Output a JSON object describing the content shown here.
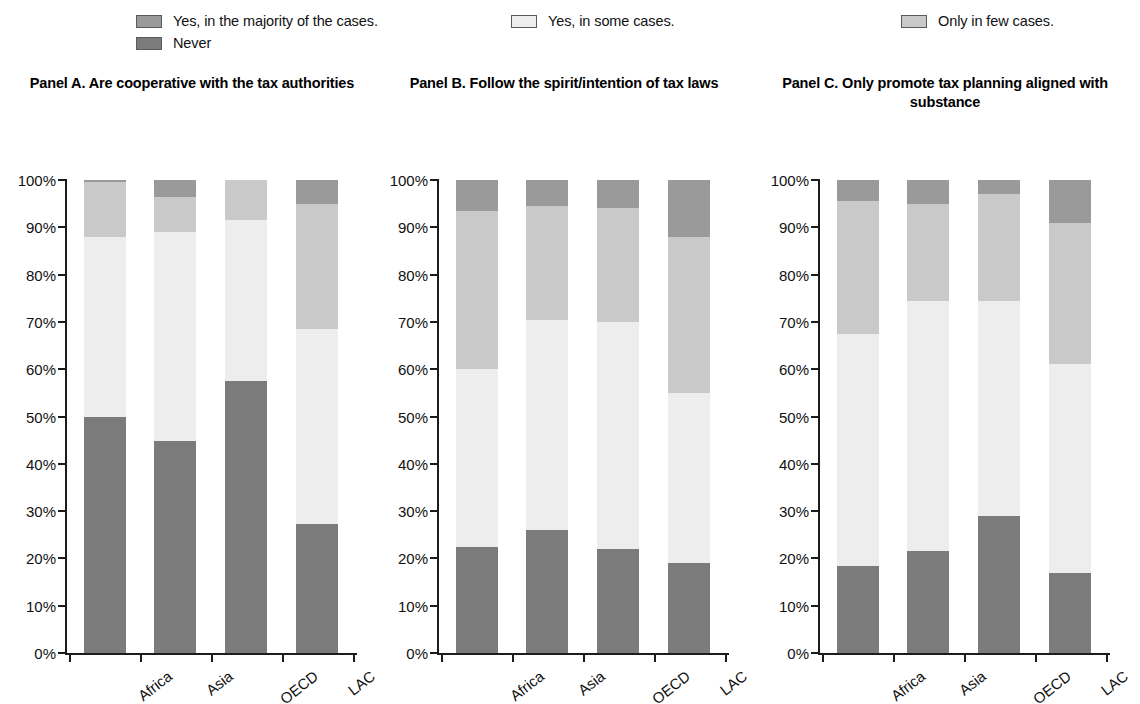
{
  "legend": {
    "entries": [
      {
        "id": "majority",
        "label": "Yes, in the majority of the cases.",
        "color": "#9a9a9a"
      },
      {
        "id": "never",
        "label": "Never",
        "color": "#7b7b7b"
      },
      {
        "id": "some",
        "label": "Yes, in some cases.",
        "color": "#ededed"
      },
      {
        "id": "few",
        "label": "Only in few cases.",
        "color": "#c9c9c9"
      }
    ]
  },
  "axis": {
    "ytick_labels": [
      "100%",
      "90%",
      "80%",
      "70%",
      "60%",
      "50%",
      "40%",
      "30%",
      "20%",
      "10%",
      "0%"
    ],
    "ytick_values": [
      100,
      90,
      80,
      70,
      60,
      50,
      40,
      30,
      20,
      10,
      0
    ]
  },
  "chart_data": {
    "type": "bar",
    "subtype": "stacked-100-percent",
    "title": "",
    "xlabel": "",
    "ylabel": "",
    "ylim": [
      0,
      100
    ],
    "yticks": [
      0,
      10,
      20,
      30,
      40,
      50,
      60,
      70,
      80,
      90,
      100
    ],
    "ytick_labels": [
      "0%",
      "10%",
      "20%",
      "30%",
      "40%",
      "50%",
      "60%",
      "70%",
      "80%",
      "90%",
      "100%"
    ],
    "grid": false,
    "legend_position": "top",
    "categories": [
      "Africa",
      "Asia",
      "OECD",
      "LAC"
    ],
    "stack_order_bottom_to_top": [
      "Never",
      "Yes, in some cases.",
      "Only in few cases.",
      "Yes, in the majority of the cases."
    ],
    "colors": {
      "Never": "#7b7b7b",
      "Yes, in some cases.": "#ededed",
      "Only in few cases.": "#c9c9c9",
      "Yes, in the majority of the cases.": "#9a9a9a"
    },
    "panels": [
      {
        "id": "A",
        "title": "Panel A. Are cooperative with the tax authorities",
        "series": [
          {
            "name": "Never",
            "values": [
              49.8,
              44.8,
              57.6,
              27.2
            ]
          },
          {
            "name": "Yes, in some cases.",
            "values": [
              38.2,
              44.2,
              33.9,
              41.3
            ]
          },
          {
            "name": "Only in few cases.",
            "values": [
              11.5,
              7.5,
              8.5,
              26.5
            ]
          },
          {
            "name": "Yes, in the majority of the cases.",
            "values": [
              0.5,
              3.5,
              0.0,
              5.0
            ]
          }
        ]
      },
      {
        "id": "B",
        "title": "Panel B. Follow the spirit/intention of tax laws",
        "series": [
          {
            "name": "Never",
            "values": [
              22.5,
              26.0,
              22.0,
              19.0
            ]
          },
          {
            "name": "Yes, in some cases.",
            "values": [
              37.5,
              44.5,
              48.0,
              36.0
            ]
          },
          {
            "name": "Only in few cases.",
            "values": [
              33.5,
              24.0,
              24.0,
              33.0
            ]
          },
          {
            "name": "Yes, in the majority of the cases.",
            "values": [
              6.5,
              5.5,
              6.0,
              12.0
            ]
          }
        ]
      },
      {
        "id": "C",
        "title": "Panel C. Only promote tax planning aligned with substance",
        "series": [
          {
            "name": "Never",
            "values": [
              18.5,
              21.5,
              29.0,
              17.0
            ]
          },
          {
            "name": "Yes, in some cases.",
            "values": [
              49.0,
              53.0,
              45.5,
              44.0
            ]
          },
          {
            "name": "Only in few cases.",
            "values": [
              28.0,
              20.5,
              22.5,
              30.0
            ]
          },
          {
            "name": "Yes, in the majority of the cases.",
            "values": [
              4.5,
              5.0,
              3.0,
              9.0
            ]
          }
        ]
      }
    ]
  }
}
